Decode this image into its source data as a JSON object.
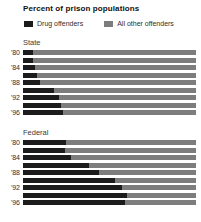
{
  "title": "Percent of prison populations",
  "legend": [
    {
      "label": "Drug offenders",
      "color": "#1c1c1c"
    },
    {
      "label": "All other offenders",
      "color": "#7d7d7d"
    }
  ],
  "colors": {
    "drug": "#1c1c1c",
    "other": "#7d7d7d",
    "background": "#ffffff"
  },
  "chart_data": {
    "type": "bar",
    "orientation": "horizontal",
    "stacked": true,
    "unit": "percent of prison population",
    "xlim": [
      0,
      100
    ],
    "grid": false,
    "legend_position": "top",
    "series_names": [
      "Drug offenders",
      "All other offenders"
    ],
    "note": "Other-offenders segment equals 100 minus drug percentage",
    "sections": [
      {
        "label": "State",
        "years": [
          1980,
          1982,
          1984,
          1986,
          1988,
          1990,
          1992,
          1994,
          1996
        ],
        "tick_labels": [
          "'80",
          "",
          "'84",
          "",
          "'88",
          "",
          "'92",
          "",
          "'96"
        ],
        "drug_pct": [
          6,
          6,
          7,
          8,
          10,
          18,
          21,
          22,
          23
        ]
      },
      {
        "label": "Federal",
        "years": [
          1980,
          1982,
          1984,
          1986,
          1988,
          1990,
          1992,
          1994,
          1996
        ],
        "tick_labels": [
          "'80",
          "",
          "'84",
          "",
          "'88",
          "",
          "'92",
          "",
          "'96"
        ],
        "drug_pct": [
          25,
          24,
          28,
          38,
          44,
          53,
          57,
          60,
          59
        ]
      }
    ]
  }
}
